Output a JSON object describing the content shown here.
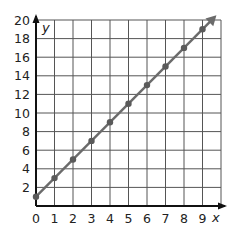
{
  "chart_data": {
    "type": "line",
    "title": "",
    "xlabel": "x",
    "ylabel": "y",
    "xlim": [
      0,
      10
    ],
    "ylim": [
      0,
      20
    ],
    "x_ticks": [
      0,
      1,
      2,
      3,
      4,
      5,
      6,
      7,
      8,
      9
    ],
    "y_ticks": [
      2,
      4,
      6,
      8,
      10,
      12,
      14,
      16,
      18,
      20
    ],
    "grid": true,
    "legend": null,
    "series": [
      {
        "name": "y = 2x + 1",
        "x": [
          0,
          1,
          2,
          3,
          4,
          5,
          6,
          7,
          8,
          9
        ],
        "y": [
          1,
          3,
          5,
          7,
          9,
          11,
          13,
          15,
          17,
          19
        ],
        "markers": true,
        "arrow_end": true,
        "color": "#6b6b6b"
      }
    ]
  },
  "labels": {
    "x_axis": "x",
    "y_axis": "y",
    "x_ticks": [
      "0",
      "1",
      "2",
      "3",
      "4",
      "5",
      "6",
      "7",
      "8",
      "9"
    ],
    "y_ticks": [
      "2",
      "4",
      "6",
      "8",
      "10",
      "12",
      "14",
      "16",
      "18",
      "20"
    ]
  },
  "colors": {
    "grid": "#555555",
    "axis": "#111111",
    "line": "#6b6b6b",
    "marker": "#5a5a5a"
  }
}
